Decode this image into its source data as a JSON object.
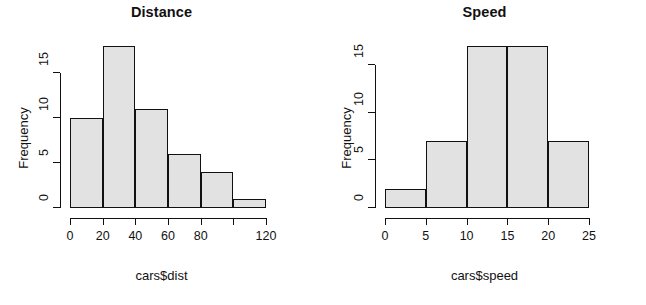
{
  "figure": {
    "background": "#ffffff",
    "bar_fill": "#e2e2e2",
    "bar_border": "#111111",
    "axis_color": "#111111"
  },
  "chart_data": [
    {
      "type": "bar",
      "title": "Distance",
      "xlabel": "cars$dist",
      "ylabel": "Frequency",
      "bin_width": 20,
      "bin_edges": [
        0,
        20,
        40,
        60,
        80,
        100,
        120
      ],
      "categories": [
        "0-20",
        "20-40",
        "40-60",
        "60-80",
        "80-100",
        "100-120"
      ],
      "values": [
        10,
        18,
        11,
        6,
        4,
        1
      ],
      "xlim": [
        0,
        120
      ],
      "ylim": [
        0,
        18
      ],
      "x_ticks": [
        0,
        20,
        40,
        60,
        80,
        100,
        120
      ],
      "x_tick_labels": [
        "0",
        "20",
        "40",
        "60",
        "80",
        "",
        "120"
      ],
      "y_ticks": [
        0,
        5,
        10,
        15
      ],
      "y_tick_labels": [
        "0",
        "5",
        "10",
        "15"
      ],
      "grid": false,
      "legend": false
    },
    {
      "type": "bar",
      "title": "Speed",
      "xlabel": "cars$speed",
      "ylabel": "Frequency",
      "bin_width": 5,
      "bin_edges": [
        0,
        5,
        10,
        15,
        20,
        25
      ],
      "categories": [
        "0-5",
        "5-10",
        "10-15",
        "15-20",
        "20-25"
      ],
      "values": [
        2,
        7,
        17,
        17,
        7
      ],
      "xlim": [
        0,
        25
      ],
      "ylim": [
        0,
        17
      ],
      "x_ticks": [
        0,
        5,
        10,
        15,
        20,
        25
      ],
      "x_tick_labels": [
        "0",
        "5",
        "10",
        "15",
        "20",
        "25"
      ],
      "y_ticks": [
        0,
        5,
        10,
        15
      ],
      "y_tick_labels": [
        "0",
        "5",
        "10",
        "15"
      ],
      "grid": false,
      "legend": false
    }
  ]
}
